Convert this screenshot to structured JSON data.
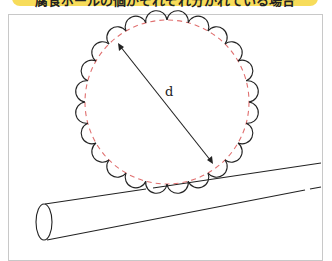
{
  "banner": {
    "title": "腐食ボールの個がそれぞれ分かれている場合",
    "color": "#f7dc5a"
  },
  "diagram": {
    "dimension_label": "d",
    "circle": {
      "cx": 167,
      "cy": 102,
      "r": 82,
      "dash_color": "#e07070",
      "scallop_count": 24
    },
    "arrow": {
      "x1": 118,
      "y1": 43,
      "x2": 213,
      "y2": 164
    },
    "rod": {
      "description": "cylindrical rod beneath circle"
    }
  }
}
